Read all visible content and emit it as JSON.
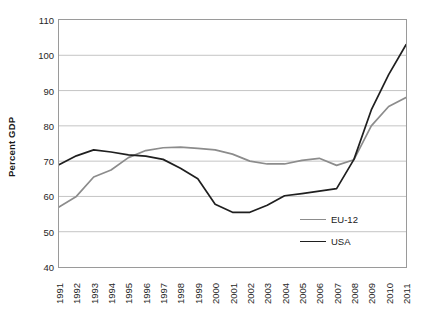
{
  "chart_data": {
    "type": "line",
    "title": "",
    "xlabel": "",
    "ylabel": "Percent GDP",
    "ylim": [
      40,
      110
    ],
    "ytick_step": 10,
    "yticks": [
      110,
      100,
      90,
      80,
      70,
      60,
      50,
      40
    ],
    "grid": true,
    "grid_axis": "y",
    "legend_position": "inside-bottom-right",
    "x": [
      1991,
      1992,
      1993,
      1994,
      1995,
      1996,
      1997,
      1998,
      1999,
      2000,
      2001,
      2002,
      2003,
      2004,
      2005,
      2006,
      2007,
      2008,
      2009,
      2010,
      2011
    ],
    "categories": [
      "1991",
      "1992",
      "1993",
      "1994",
      "1995",
      "1996",
      "1997",
      "1998",
      "1999",
      "2000",
      "2001",
      "2002",
      "2003",
      "2004",
      "2005",
      "2006",
      "2007",
      "2008",
      "2009",
      "2010",
      "2011"
    ],
    "series": [
      {
        "name": "EU-12",
        "color": "#8c8c8c",
        "values": [
          57.0,
          60.0,
          65.5,
          67.5,
          71.0,
          73.0,
          73.8,
          74.0,
          73.6,
          73.2,
          72.0,
          70.0,
          69.2,
          69.2,
          70.2,
          70.8,
          68.8,
          70.4,
          80.0,
          85.5,
          88.0
        ]
      },
      {
        "name": "USA",
        "color": "#1f1f1f",
        "values": [
          69.0,
          71.5,
          73.2,
          72.6,
          71.8,
          71.4,
          70.5,
          68.0,
          65.0,
          57.8,
          55.5,
          55.5,
          57.5,
          60.2,
          60.8,
          61.5,
          62.2,
          70.5,
          84.5,
          94.5,
          103.0
        ]
      }
    ]
  },
  "legend": {
    "items": [
      {
        "label": "EU-12",
        "color": "#8c8c8c"
      },
      {
        "label": "USA",
        "color": "#1f1f1f"
      }
    ]
  }
}
